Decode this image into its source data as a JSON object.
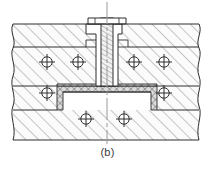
{
  "figure": {
    "caption": "(b)",
    "background_color": "#ffffff",
    "line_color": "#333333",
    "hatch_color": "#6b6b6b",
    "centerline_color": "#8a8a8a",
    "gasket_fill": "#d9d9d9",
    "metal_fill": "#fbfbfb"
  },
  "drawing": {
    "type": "engineering-section",
    "view": "half-section, broken at left and right by wavy break lines",
    "canvas": {
      "width": 215,
      "height": 171
    },
    "centerline": {
      "x": 107,
      "y_top": 2,
      "y_bottom": 144
    },
    "parts": [
      {
        "name": "upper-body",
        "label": "upper housing / cover plate",
        "hatch": "45deg",
        "region": "top slab between y=22 and y=86"
      },
      {
        "name": "lower-body",
        "label": "lower housing / base",
        "hatch": "45deg",
        "region": "bottom slab between y=86 and y=140"
      },
      {
        "name": "gasket",
        "label": "gasket / sealing ring",
        "hatch": "cross-hatch",
        "region": "inverted-U band around central boss"
      },
      {
        "name": "stud",
        "label": "central stud / screw shank",
        "hatch": "fine-vertical",
        "region": "vertical member on centerline"
      },
      {
        "name": "stud-head",
        "label": "stud head / nut",
        "region": "flat head at top, y=18 to y=24"
      },
      {
        "name": "central-boss",
        "label": "central boss / spigot",
        "region": "stepped column under stud head"
      }
    ],
    "fastener_marks": {
      "name": "bolt-hole-center-marks",
      "style": "circle with cross-hair",
      "radius": 5.2,
      "count": 9,
      "positions": [
        {
          "x": 47,
          "y": 62
        },
        {
          "x": 78,
          "y": 62
        },
        {
          "x": 134,
          "y": 62
        },
        {
          "x": 164,
          "y": 62
        },
        {
          "x": 47,
          "y": 93
        },
        {
          "x": 164,
          "y": 93
        },
        {
          "x": 86,
          "y": 117
        },
        {
          "x": 124,
          "y": 117
        }
      ]
    },
    "break_lines": [
      {
        "name": "left-break-line",
        "x": 13,
        "style": "wavy",
        "y_from": 24,
        "y_to": 140
      },
      {
        "name": "right-break-line",
        "x": 199,
        "style": "wavy",
        "y_from": 24,
        "y_to": 140
      }
    ],
    "horizontal_edges": [
      {
        "name": "upper-outer-top",
        "y": 24
      },
      {
        "name": "upper-inner-step",
        "y": 47
      },
      {
        "name": "parting-line",
        "y": 86
      },
      {
        "name": "lower-step",
        "y": 107
      },
      {
        "name": "base-bottom",
        "y": 140
      }
    ]
  }
}
